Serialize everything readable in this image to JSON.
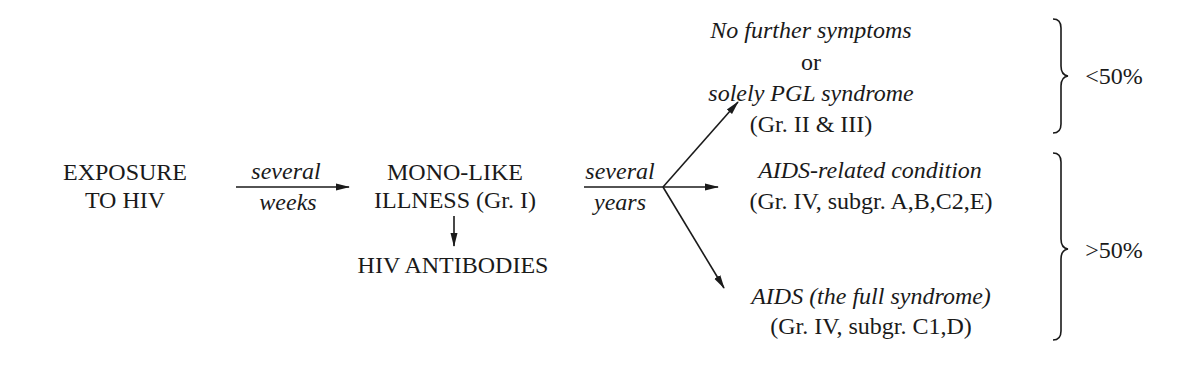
{
  "diagram": {
    "nodes": {
      "exposure": {
        "line1": "EXPOSURE",
        "line2": "TO HIV"
      },
      "mono": {
        "line1": "MONO-LIKE",
        "line2": "ILLNESS (Gr. I)"
      },
      "antibodies": {
        "label": "HIV ANTIBODIES"
      },
      "no_symptoms": {
        "line1": "No further symptoms",
        "line2": "or",
        "line3": "solely PGL syndrome",
        "line4": "(Gr. II & III)"
      },
      "arc": {
        "line1": "AIDS-related condition",
        "line2": "(Gr. IV, subgr. A,B,C2,E)"
      },
      "aids": {
        "line1": "AIDS (the full syndrome)",
        "line2": "(Gr. IV, subgr. C1,D)"
      }
    },
    "edges": {
      "exposure_to_mono": {
        "above": "several",
        "below": "weeks"
      },
      "mono_to_outcomes": {
        "above": "several",
        "below": "years"
      }
    },
    "groups": {
      "minority": {
        "label": "<50%"
      },
      "majority": {
        "label": ">50%"
      }
    }
  }
}
